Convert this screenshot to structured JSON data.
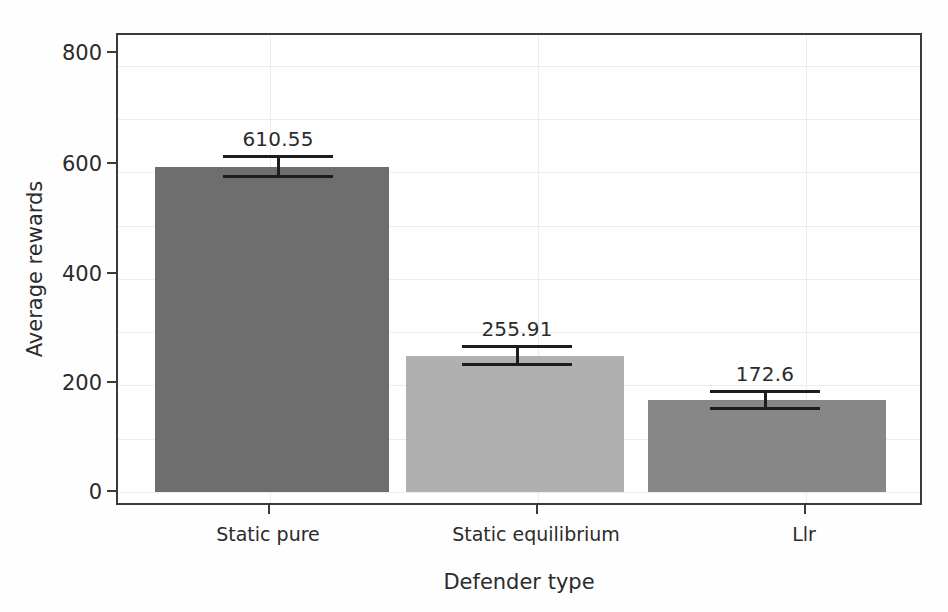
{
  "chart_data": {
    "type": "bar",
    "title": "",
    "xlabel": "Defender type",
    "ylabel": "Average rewards",
    "categories": [
      "Static pure",
      "Static equilibrium",
      "Llr"
    ],
    "values": [
      610.55,
      255.91,
      172.6
    ],
    "value_labels": [
      "610.55",
      "255.91",
      "172.6"
    ],
    "errors": [
      21.0,
      19.0,
      19.0
    ],
    "bar_colors": [
      "#6e6e6e",
      "#b0b0b0",
      "#878787"
    ],
    "ylim": [
      0,
      850
    ],
    "yticks": [
      0,
      200,
      400,
      600,
      800
    ],
    "ytick_labels": [
      "0",
      "200",
      "400",
      "600",
      "800"
    ],
    "minor_gridlines": [
      100,
      300,
      500,
      700
    ],
    "grid": true,
    "legend": null,
    "errorbar_color": "#1d1d1d",
    "frame_color": "#3a3a3a",
    "grid_color": "#ececec",
    "background": "#ffffff"
  }
}
